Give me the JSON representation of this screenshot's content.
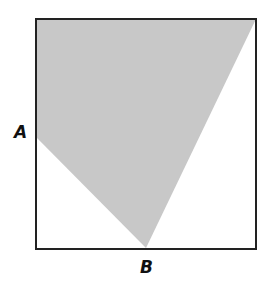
{
  "diagram": {
    "square": {
      "x1": 36,
      "y1": 19,
      "x2": 256,
      "y2": 249,
      "stroke": "#222222"
    },
    "shaded_region": {
      "fill": "#c8c8c8",
      "vertices": [
        [
          36,
          19
        ],
        [
          256,
          19
        ],
        [
          146,
          248
        ],
        [
          36,
          137
        ]
      ]
    },
    "labels": {
      "a": "A",
      "b": "B"
    },
    "points": {
      "A": [
        36,
        137
      ],
      "B": [
        146,
        248
      ]
    }
  }
}
